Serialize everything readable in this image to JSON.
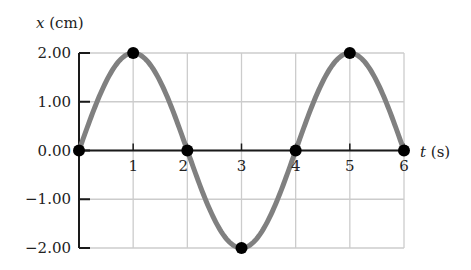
{
  "chart_data": {
    "type": "line",
    "title": "",
    "xlabel_var": "t",
    "xlabel_unit": "(s)",
    "ylabel_var": "x",
    "ylabel_unit": "(cm)",
    "xlim": [
      0,
      6
    ],
    "ylim": [
      -2.0,
      2.0
    ],
    "grid": true,
    "x_ticks": [
      "1",
      "2",
      "3",
      "4",
      "5",
      "6"
    ],
    "y_ticks": [
      "2.00",
      "1.00",
      "0.00",
      "−1.00",
      "−2.00"
    ],
    "y_tick_values": [
      2,
      1,
      0,
      -1,
      -2
    ],
    "series": [
      {
        "name": "x(t) = 2.00 sin(πt/2)",
        "amplitude": 2.0,
        "period": 4,
        "color": "#808080"
      }
    ],
    "highlighted_points": [
      {
        "t": 0,
        "x": 0
      },
      {
        "t": 1,
        "x": 2.0
      },
      {
        "t": 2,
        "x": 0
      },
      {
        "t": 3,
        "x": -2.0
      },
      {
        "t": 4,
        "x": 0
      },
      {
        "t": 5,
        "x": 2.0
      },
      {
        "t": 6,
        "x": 0
      }
    ]
  },
  "colors": {
    "curve": "#808080",
    "grid": "#cccccc",
    "axis": "#1a1a1a",
    "point": "#000000"
  }
}
